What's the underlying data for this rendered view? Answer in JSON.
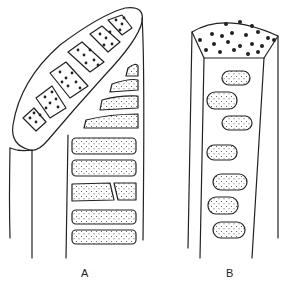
{
  "figure": {
    "panels": [
      {
        "id": "A",
        "label": "A",
        "description": "Elongated oval structure angled diagonally at upper left, containing a row of rectangular cells with large dots, set atop a column of stippled rectangular cells"
      },
      {
        "id": "B",
        "label": "B",
        "description": "Hexagonal prism column with a densely dotted top face and rounded stippled cells along the front face"
      }
    ],
    "colors": {
      "stroke": "#222222",
      "background": "#ffffff"
    }
  }
}
